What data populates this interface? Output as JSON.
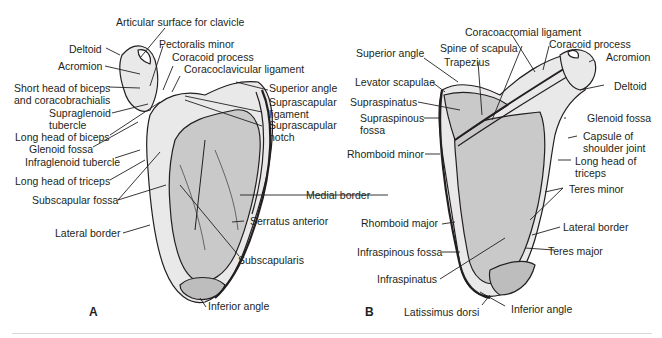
{
  "figure": {
    "panels": [
      {
        "id": "A",
        "label": "A",
        "view": "anterior",
        "labels": [
          "Articular surface for clavicle",
          "Deltoid",
          "Acromion",
          "Pectoralis minor",
          "Coracoid process",
          "Coracoclavicular ligament",
          "Short head of biceps",
          "and coracobrachialis",
          "Supraglenoid",
          "tubercle",
          "Long head of biceps",
          "Glenoid fossa",
          "Infraglenoid tubercle",
          "Long head of triceps",
          "Subscapular fossa",
          "Lateral border",
          "Superior angle",
          "Suprascapular",
          "ligament",
          "Suprascapular",
          "notch",
          "Medial border",
          "Serratus anterior",
          "Subscapularis",
          "Inferior angle"
        ]
      },
      {
        "id": "B",
        "label": "B",
        "view": "posterior",
        "labels": [
          "Coracoacromial ligament",
          "Spine of scapula",
          "Coracoid process",
          "Acromion",
          "Superior angle",
          "Trapezius",
          "Levator scapulae",
          "Deltoid",
          "Supraspinatus",
          "Glenoid fossa",
          "Supraspinous",
          "fossa",
          "Capsule of",
          "shoulder joint",
          "Rhomboid minor",
          "Long head of",
          "triceps",
          "Teres minor",
          "Rhomboid major",
          "Lateral border",
          "Infraspinous fossa",
          "Teres major",
          "Infraspinatus",
          "Latissimus dorsi",
          "Inferior angle"
        ]
      }
    ],
    "colors": {
      "bone_fill": "#c9c9c9",
      "bone_light": "#e9e9e9",
      "outline": "#231f20",
      "rule": "#d9d9d9"
    }
  }
}
